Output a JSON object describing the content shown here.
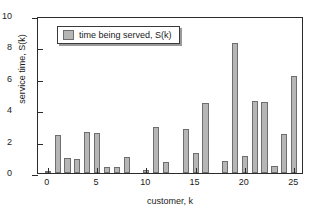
{
  "chart_data": {
    "type": "bar",
    "title": "",
    "xlabel": "customer, k",
    "ylabel": "service time, S(k)",
    "xlim": [
      -1,
      26
    ],
    "ylim": [
      0,
      10
    ],
    "xticks": [
      0,
      5,
      10,
      15,
      20,
      25
    ],
    "yticks": [
      0,
      2,
      4,
      6,
      8,
      10
    ],
    "grid": false,
    "legend": {
      "position": "top-left",
      "entries": [
        {
          "label": "time being served, S(k)",
          "color": "#b6b6b6"
        }
      ]
    },
    "series": [
      {
        "name": "time being served, S(k)",
        "color": "#b6b6b6",
        "edge_color": "#6e6e6e",
        "x": [
          0,
          1,
          2,
          3,
          4,
          5,
          6,
          7,
          8,
          9,
          10,
          11,
          12,
          13,
          14,
          15,
          16,
          17,
          18,
          19,
          20,
          21,
          22,
          23,
          24,
          25
        ],
        "values": [
          0.05,
          2.42,
          0.95,
          0.88,
          2.62,
          2.52,
          0.36,
          0.38,
          1.05,
          0.0,
          0.18,
          2.95,
          0.72,
          0.0,
          2.82,
          1.25,
          4.45,
          0.0,
          0.78,
          8.3,
          1.1,
          4.6,
          4.55,
          0.45,
          2.48,
          6.15
        ]
      }
    ]
  }
}
